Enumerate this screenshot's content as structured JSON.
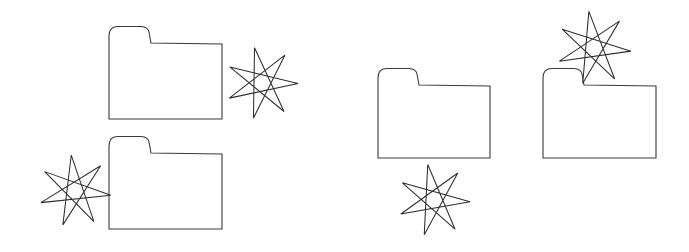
{
  "image": {
    "title": "Folder and star line drawing",
    "width": 689,
    "height": 252,
    "background_color": "#ffffff",
    "stroke_color": "#3a3a3a",
    "star_stroke_color": "#2e2e2e",
    "fill_color": "#ffffff",
    "description": "Black-and-white line art showing four folder outlines and four seven-pointed stars arranged in two clusters"
  },
  "counts": {
    "folders": 4,
    "stars": 4,
    "total_shapes": 8
  },
  "groups": [
    {
      "name": "left-group",
      "label": "Left cluster",
      "folders": 2,
      "stars": 2
    },
    {
      "name": "right-group",
      "label": "Right cluster",
      "folders": 2,
      "stars": 2
    }
  ],
  "shapes": [
    {
      "id": "folder-1",
      "kind": "folder",
      "group": "left-group",
      "label": "Folder 1",
      "x": 109,
      "y": 27,
      "width": 113,
      "height": 92,
      "tab_width": 38,
      "tab_height": 17,
      "corner_radius": 6
    },
    {
      "id": "star-1",
      "kind": "star",
      "group": "left-group",
      "label": "Star 1",
      "points": 7,
      "skip": 3,
      "center_x": 262,
      "center_y": 83,
      "outer_radius": 36,
      "rotation_deg": -12
    },
    {
      "id": "folder-2",
      "kind": "folder",
      "group": "left-group",
      "label": "Folder 2",
      "x": 109,
      "y": 137,
      "width": 113,
      "height": 92,
      "tab_width": 38,
      "tab_height": 17,
      "corner_radius": 6
    },
    {
      "id": "star-2",
      "kind": "star",
      "group": "left-group",
      "label": "Star 2",
      "points": 7,
      "skip": 3,
      "center_x": 75,
      "center_y": 191,
      "outer_radius": 36,
      "rotation_deg": -6
    },
    {
      "id": "folder-3",
      "kind": "folder",
      "group": "right-group",
      "label": "Folder 3",
      "x": 378,
      "y": 69,
      "width": 112,
      "height": 89,
      "tab_width": 37,
      "tab_height": 17,
      "corner_radius": 6
    },
    {
      "id": "star-3",
      "kind": "star",
      "group": "right-group",
      "label": "Star 3",
      "points": 7,
      "skip": 3,
      "center_x": 434,
      "center_y": 200,
      "outer_radius": 36,
      "rotation_deg": -10
    },
    {
      "id": "folder-4",
      "kind": "folder",
      "group": "right-group",
      "label": "Folder 4",
      "x": 543,
      "y": 69,
      "width": 113,
      "height": 89,
      "tab_width": 37,
      "tab_height": 17,
      "corner_radius": 6
    },
    {
      "id": "star-4",
      "kind": "star",
      "group": "right-group",
      "label": "Star 4",
      "points": 7,
      "skip": 3,
      "center_x": 594,
      "center_y": 48,
      "outer_radius": 37,
      "rotation_deg": -8
    }
  ]
}
